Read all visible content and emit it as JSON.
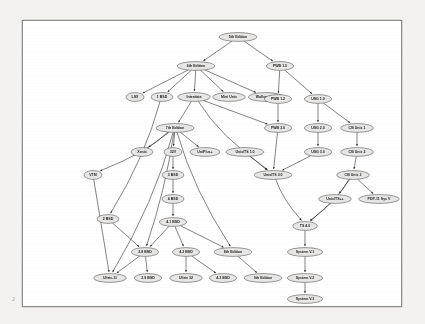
{
  "document": {
    "corner_mark": "2",
    "page_background_color": "#f3f2f0",
    "paper_color": "#ffffff",
    "border_color": "#8d8d8d"
  },
  "chart_data": {
    "type": "diagram",
    "diagram_type": "directed-acyclic-graph",
    "title": "",
    "node_fill_color": "#e8e7e6",
    "node_stroke_color": "#4a4a4a",
    "edge_color": "#2f2f2f",
    "nodes": [
      {
        "id": "n_5th",
        "label": "5th Edition",
        "x": 215,
        "y": 16
      },
      {
        "id": "n_6th",
        "label": "6th Edition",
        "x": 173,
        "y": 45
      },
      {
        "id": "n_pws10",
        "label": "PWB 1.0",
        "x": 257,
        "y": 45
      },
      {
        "id": "n_lsx",
        "label": "LSX",
        "x": 112,
        "y": 76
      },
      {
        "id": "n_1bsd",
        "label": "1 BSD",
        "x": 139,
        "y": 76
      },
      {
        "id": "n_interdata",
        "label": "Interdata",
        "x": 171,
        "y": 76
      },
      {
        "id": "n_miniunix",
        "label": "Mini Unix",
        "x": 206,
        "y": 76
      },
      {
        "id": "n_wollongong",
        "label": "Wollongong",
        "x": 243,
        "y": 76
      },
      {
        "id": "n_pws12",
        "label": "PWB 1.2",
        "x": 255,
        "y": 78
      },
      {
        "id": "n_usg10",
        "label": "USG 1.0",
        "x": 295,
        "y": 78
      },
      {
        "id": "n_7th",
        "label": "7th Edition",
        "x": 152,
        "y": 107
      },
      {
        "id": "n_pws20",
        "label": "PWB 2.0",
        "x": 255,
        "y": 107
      },
      {
        "id": "n_usg20",
        "label": "USG 2.0",
        "x": 295,
        "y": 107
      },
      {
        "id": "n_csunit1",
        "label": "CB Unix 1",
        "x": 334,
        "y": 107
      },
      {
        "id": "n_xenix",
        "label": "Xenix",
        "x": 119,
        "y": 131
      },
      {
        "id": "n_32v",
        "label": "32V",
        "x": 150,
        "y": 131
      },
      {
        "id": "n_uniplus",
        "label": "UniPlus+",
        "x": 182,
        "y": 131
      },
      {
        "id": "n_unixts10",
        "label": "Unix/TS 1.0",
        "x": 222,
        "y": 131
      },
      {
        "id": "n_usg30",
        "label": "USG 3.0",
        "x": 295,
        "y": 131
      },
      {
        "id": "n_csunit2",
        "label": "CB Unix 2",
        "x": 334,
        "y": 131
      },
      {
        "id": "n_vm",
        "label": "VTM",
        "x": 70,
        "y": 154
      },
      {
        "id": "n_unixts30",
        "label": "Unix/TS 3.0",
        "x": 250,
        "y": 154
      },
      {
        "id": "n_csunit3",
        "label": "CB Unix 3",
        "x": 330,
        "y": 154
      },
      {
        "id": "n_3bsd",
        "label": "3 BSD",
        "x": 150,
        "y": 154
      },
      {
        "id": "n_unixts4",
        "label": "Unix/TS++",
        "x": 312,
        "y": 178
      },
      {
        "id": "n_pdp11",
        "label": "PDP-11 Sys V",
        "x": 356,
        "y": 178
      },
      {
        "id": "n_4bsd",
        "label": "4 BSD",
        "x": 150,
        "y": 178
      },
      {
        "id": "n_2bsd",
        "label": "2 BSD",
        "x": 85,
        "y": 198
      },
      {
        "id": "n_41bsd",
        "label": "4.1 BSD",
        "x": 150,
        "y": 201
      },
      {
        "id": "n_ts40",
        "label": "TS 4.0",
        "x": 282,
        "y": 205
      },
      {
        "id": "n_28bsd",
        "label": "2.8 BSD",
        "x": 122,
        "y": 231
      },
      {
        "id": "n_42bsd",
        "label": "4.2 BSD",
        "x": 163,
        "y": 231
      },
      {
        "id": "n_8thed",
        "label": "8th Edition",
        "x": 210,
        "y": 231
      },
      {
        "id": "n_sysv1",
        "label": "System V.1",
        "x": 282,
        "y": 231
      },
      {
        "id": "n_ultrix11",
        "label": "Ultrix-11",
        "x": 87,
        "y": 257
      },
      {
        "id": "n_29bsd",
        "label": "2.9 BSD",
        "x": 125,
        "y": 257
      },
      {
        "id": "n_ultrix32",
        "label": "Ultrix 32",
        "x": 163,
        "y": 257
      },
      {
        "id": "n_43bsd",
        "label": "4.3 BSD",
        "x": 200,
        "y": 257
      },
      {
        "id": "n_9thed",
        "label": "9th Edition",
        "x": 240,
        "y": 257
      },
      {
        "id": "n_sysv2",
        "label": "System V.2",
        "x": 282,
        "y": 257
      },
      {
        "id": "n_sysv3",
        "label": "System V.3",
        "x": 282,
        "y": 278
      }
    ],
    "edges": [
      {
        "from": "n_5th",
        "to": "n_6th"
      },
      {
        "from": "n_5th",
        "to": "n_pws10"
      },
      {
        "from": "n_6th",
        "to": "n_lsx"
      },
      {
        "from": "n_6th",
        "to": "n_1bsd"
      },
      {
        "from": "n_6th",
        "to": "n_interdata"
      },
      {
        "from": "n_6th",
        "to": "n_miniunix"
      },
      {
        "from": "n_6th",
        "to": "n_wollongong"
      },
      {
        "from": "n_pws10",
        "to": "n_pws12"
      },
      {
        "from": "n_pws10",
        "to": "n_usg10"
      },
      {
        "from": "n_pws12",
        "to": "n_pws20"
      },
      {
        "from": "n_usg10",
        "to": "n_usg20"
      },
      {
        "from": "n_usg10",
        "to": "n_csunit1"
      },
      {
        "from": "n_interdata",
        "to": "n_7th"
      },
      {
        "from": "n_interdata",
        "to": "n_unixts30"
      },
      {
        "from": "n_interdata",
        "to": "n_pws20"
      },
      {
        "from": "n_7th",
        "to": "n_xenix"
      },
      {
        "from": "n_7th",
        "to": "n_32v"
      },
      {
        "from": "n_7th",
        "to": "n_uniplus"
      },
      {
        "from": "n_7th",
        "to": "n_vm"
      },
      {
        "from": "n_7th",
        "to": "n_28bsd"
      },
      {
        "from": "n_7th",
        "to": "n_ultrix11"
      },
      {
        "from": "n_7th",
        "to": "n_8thed"
      },
      {
        "from": "n_32v",
        "to": "n_3bsd"
      },
      {
        "from": "n_3bsd",
        "to": "n_4bsd"
      },
      {
        "from": "n_4bsd",
        "to": "n_41bsd"
      },
      {
        "from": "n_41bsd",
        "to": "n_28bsd"
      },
      {
        "from": "n_41bsd",
        "to": "n_42bsd"
      },
      {
        "from": "n_41bsd",
        "to": "n_8thed"
      },
      {
        "from": "n_1bsd",
        "to": "n_2bsd"
      },
      {
        "from": "n_vm",
        "to": "n_ultrix11"
      },
      {
        "from": "n_2bsd",
        "to": "n_28bsd"
      },
      {
        "from": "n_28bsd",
        "to": "n_ultrix11"
      },
      {
        "from": "n_28bsd",
        "to": "n_29bsd"
      },
      {
        "from": "n_42bsd",
        "to": "n_ultrix32"
      },
      {
        "from": "n_42bsd",
        "to": "n_43bsd"
      },
      {
        "from": "n_8thed",
        "to": "n_9thed"
      },
      {
        "from": "n_unixts10",
        "to": "n_unixts30"
      },
      {
        "from": "n_pws20",
        "to": "n_unixts30"
      },
      {
        "from": "n_usg30",
        "to": "n_unixts30"
      },
      {
        "from": "n_usg20",
        "to": "n_usg30"
      },
      {
        "from": "n_csunit1",
        "to": "n_csunit2"
      },
      {
        "from": "n_csunit2",
        "to": "n_csunit3"
      },
      {
        "from": "n_csunit3",
        "to": "n_unixts4"
      },
      {
        "from": "n_csunit3",
        "to": "n_pdp11"
      },
      {
        "from": "n_csunit3",
        "to": "n_ts40"
      },
      {
        "from": "n_unixts4",
        "to": "n_ts40"
      },
      {
        "from": "n_unixts30",
        "to": "n_ts40"
      },
      {
        "from": "n_ts40",
        "to": "n_sysv1"
      },
      {
        "from": "n_sysv1",
        "to": "n_sysv2"
      },
      {
        "from": "n_sysv2",
        "to": "n_sysv3"
      }
    ]
  }
}
